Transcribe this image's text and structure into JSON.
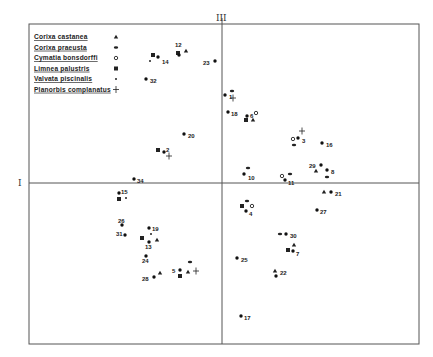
{
  "chart_data": {
    "type": "scatter",
    "title": "",
    "xlabel": "I",
    "ylabel": "III",
    "grid": false,
    "legend_position": "top-left (inside frame)",
    "note": "Ordination diagram; coordinates are in pixel space of the 433x357 image. Axis I is horizontal (y=183), axis III vertical (x=222). No numeric tick labels are shown.",
    "frame": {
      "left": 29,
      "top": 24,
      "right": 419,
      "bottom": 344
    },
    "axes": {
      "I_y": 183,
      "III_x": 222
    },
    "legend": [
      {
        "name": "Corixa castanea",
        "marker": "triangle"
      },
      {
        "name": "Corixa praeusta",
        "marker": "dash"
      },
      {
        "name": "Cymatia bonsdorffi",
        "marker": "open-circle"
      },
      {
        "name": "Limnea palustris",
        "marker": "square"
      },
      {
        "name": "Valvata piscinalis",
        "marker": "small-dot"
      },
      {
        "name": "Planorbis complanatus",
        "marker": "plus"
      }
    ],
    "sites": [
      {
        "label": "12",
        "x": 179,
        "y": 55,
        "lx": 175,
        "ly": 45
      },
      {
        "label": "14",
        "x": 158,
        "y": 57,
        "lx": 162,
        "ly": 62
      },
      {
        "label": "32",
        "x": 146,
        "y": 79,
        "lx": 150,
        "ly": 81
      },
      {
        "label": "23",
        "x": 215,
        "y": 61,
        "lx": 203,
        "ly": 63
      },
      {
        "label": "1",
        "x": 225,
        "y": 95,
        "lx": 229,
        "ly": 97
      },
      {
        "label": "18",
        "x": 228,
        "y": 112,
        "lx": 231,
        "ly": 114
      },
      {
        "label": "6",
        "x": 247,
        "y": 116,
        "lx": 250,
        "ly": 116
      },
      {
        "label": "20",
        "x": 184,
        "y": 134,
        "lx": 188,
        "ly": 136
      },
      {
        "label": "2",
        "x": 164,
        "y": 152,
        "lx": 166,
        "ly": 150
      },
      {
        "label": "3",
        "x": 298,
        "y": 138,
        "lx": 302,
        "ly": 141
      },
      {
        "label": "16",
        "x": 322,
        "y": 143,
        "lx": 326,
        "ly": 145
      },
      {
        "label": "29",
        "x": 321,
        "y": 165,
        "lx": 309,
        "ly": 166
      },
      {
        "label": "8",
        "x": 327,
        "y": 170,
        "lx": 331,
        "ly": 172
      },
      {
        "label": "10",
        "x": 244,
        "y": 174,
        "lx": 248,
        "ly": 178
      },
      {
        "label": "11",
        "x": 285,
        "y": 180,
        "lx": 288,
        "ly": 183
      },
      {
        "label": "34",
        "x": 134,
        "y": 179,
        "lx": 137,
        "ly": 181
      },
      {
        "label": "15",
        "x": 119,
        "y": 193,
        "lx": 121,
        "ly": 192
      },
      {
        "label": "21",
        "x": 331,
        "y": 192,
        "lx": 335,
        "ly": 194
      },
      {
        "label": "4",
        "x": 246,
        "y": 211,
        "lx": 249,
        "ly": 214
      },
      {
        "label": "27",
        "x": 317,
        "y": 210,
        "lx": 320,
        "ly": 212
      },
      {
        "label": "26",
        "x": 122,
        "y": 225,
        "lx": 118,
        "ly": 221
      },
      {
        "label": "19",
        "x": 149,
        "y": 228,
        "lx": 152,
        "ly": 229
      },
      {
        "label": "31",
        "x": 125,
        "y": 235,
        "lx": 116,
        "ly": 234
      },
      {
        "label": "13",
        "x": 149,
        "y": 242,
        "lx": 145,
        "ly": 247
      },
      {
        "label": "30",
        "x": 286,
        "y": 234,
        "lx": 290,
        "ly": 236
      },
      {
        "label": "7",
        "x": 293,
        "y": 251,
        "lx": 296,
        "ly": 254
      },
      {
        "label": "24",
        "x": 146,
        "y": 256,
        "lx": 142,
        "ly": 261
      },
      {
        "label": "25",
        "x": 237,
        "y": 258,
        "lx": 241,
        "ly": 260
      },
      {
        "label": "22",
        "x": 276,
        "y": 276,
        "lx": 280,
        "ly": 273
      },
      {
        "label": "5",
        "x": 180,
        "y": 270,
        "lx": 172,
        "ly": 271
      },
      {
        "label": "28",
        "x": 154,
        "y": 277,
        "lx": 142,
        "ly": 279
      },
      {
        "label": "17",
        "x": 241,
        "y": 316,
        "lx": 244,
        "ly": 318
      }
    ],
    "markers": [
      {
        "type": "square",
        "x": 153,
        "y": 55
      },
      {
        "type": "small-dot",
        "x": 150,
        "y": 61
      },
      {
        "type": "square",
        "x": 178,
        "y": 53
      },
      {
        "type": "triangle",
        "x": 186,
        "y": 51
      },
      {
        "type": "dash",
        "x": 232,
        "y": 91
      },
      {
        "type": "plus",
        "x": 233,
        "y": 98
      },
      {
        "type": "open-circle",
        "x": 256,
        "y": 113
      },
      {
        "type": "square",
        "x": 246,
        "y": 120
      },
      {
        "type": "triangle",
        "x": 253,
        "y": 120
      },
      {
        "type": "square",
        "x": 158,
        "y": 150
      },
      {
        "type": "plus",
        "x": 169,
        "y": 156
      },
      {
        "type": "plus",
        "x": 302,
        "y": 131
      },
      {
        "type": "open-circle",
        "x": 293,
        "y": 139
      },
      {
        "type": "dash",
        "x": 294,
        "y": 145
      },
      {
        "type": "dash",
        "x": 248,
        "y": 168
      },
      {
        "type": "dash",
        "x": 290,
        "y": 174
      },
      {
        "type": "open-circle",
        "x": 282,
        "y": 176
      },
      {
        "type": "triangle",
        "x": 316,
        "y": 171
      },
      {
        "type": "dash",
        "x": 327,
        "y": 177
      },
      {
        "type": "square",
        "x": 119,
        "y": 199
      },
      {
        "type": "small-dot",
        "x": 126,
        "y": 198
      },
      {
        "type": "triangle",
        "x": 324,
        "y": 192
      },
      {
        "type": "dash",
        "x": 247,
        "y": 201
      },
      {
        "type": "square",
        "x": 242,
        "y": 206
      },
      {
        "type": "open-circle",
        "x": 252,
        "y": 206
      },
      {
        "type": "square",
        "x": 142,
        "y": 238
      },
      {
        "type": "small-dot",
        "x": 151,
        "y": 234
      },
      {
        "type": "triangle",
        "x": 157,
        "y": 240
      },
      {
        "type": "dash",
        "x": 280,
        "y": 234
      },
      {
        "type": "triangle",
        "x": 294,
        "y": 245
      },
      {
        "type": "square",
        "x": 288,
        "y": 250
      },
      {
        "type": "triangle",
        "x": 275,
        "y": 271
      },
      {
        "type": "triangle",
        "x": 160,
        "y": 273
      },
      {
        "type": "dash",
        "x": 190,
        "y": 262
      },
      {
        "type": "square",
        "x": 180,
        "y": 276
      },
      {
        "type": "triangle",
        "x": 188,
        "y": 272
      },
      {
        "type": "plus",
        "x": 196,
        "y": 271
      }
    ]
  },
  "legend": {
    "items": [
      {
        "label": "Corixa castanea",
        "symbol": "triangle"
      },
      {
        "label": "Corixa praeusta",
        "symbol": "dash"
      },
      {
        "label": "Cymatia bonsdorffi",
        "symbol": "open-circle"
      },
      {
        "label": "Limnea palustris",
        "symbol": "square"
      },
      {
        "label": "Valvata piscinalis",
        "symbol": "small-dot"
      },
      {
        "label": "Planorbis complanatus",
        "symbol": "plus"
      }
    ]
  },
  "axes": {
    "horizontal_label": "I",
    "vertical_label": "III"
  }
}
